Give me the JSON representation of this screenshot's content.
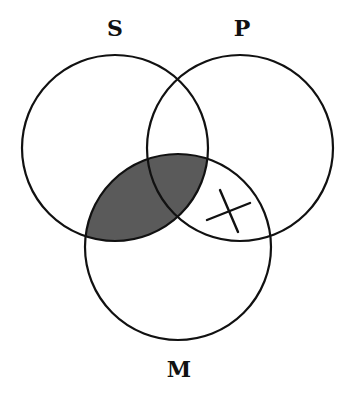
{
  "diagram": {
    "type": "venn-3",
    "circles": [
      {
        "id": "S",
        "label": "S",
        "cx": 115,
        "cy": 148,
        "r": 93
      },
      {
        "id": "P",
        "label": "P",
        "cx": 240,
        "cy": 148,
        "r": 93
      },
      {
        "id": "M",
        "label": "M",
        "cx": 178,
        "cy": 247,
        "r": 93
      }
    ],
    "labels": {
      "S": "S",
      "P": "P",
      "M": "M"
    },
    "shaded_region": "S ∩ M",
    "marked_region": {
      "region": "P ∩ M − S",
      "mark": "X"
    },
    "colors": {
      "stroke": "#111111",
      "shade": "#5a5a5a",
      "background": "#ffffff"
    }
  }
}
